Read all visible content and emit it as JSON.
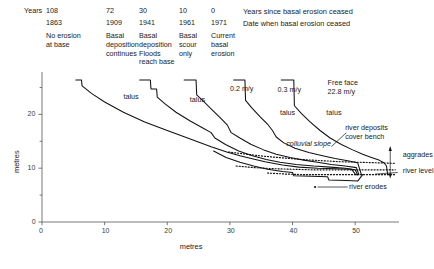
{
  "header": {
    "years_label": "Years",
    "columns": [
      {
        "years_since": "108",
        "date": "1863",
        "desc": "No erosion\nat base",
        "x": 46
      },
      {
        "years_since": "72",
        "date": "1909",
        "desc": "Basal\ndeposition\ncontinues",
        "x": 106
      },
      {
        "years_since": "30",
        "date": "1941",
        "desc": "Basal\ndeposition\nFloods\nreach base",
        "x": 139
      },
      {
        "years_since": "10",
        "date": "1961",
        "desc": "Basal\nscour\nonly",
        "x": 179
      },
      {
        "years_since": "0",
        "date": "1971",
        "desc": "Current\nbasal\nerosion",
        "x": 211
      }
    ],
    "legend_row1": "Years since basal erosion ceased",
    "legend_row2": "Date when basal erosion ceased",
    "legend_x": 243
  },
  "chart_data": {
    "type": "line",
    "title": "",
    "xlabel": "metres",
    "ylabel": "metres",
    "xlim": [
      0,
      57
    ],
    "ylim": [
      0,
      27.5
    ],
    "xticks": [
      0,
      10,
      20,
      30,
      40,
      50
    ],
    "yticks": [
      0,
      10,
      20
    ],
    "yticks_minor": [
      5,
      15,
      25
    ],
    "grid": false,
    "legend_position": "none",
    "series": [
      {
        "name": "1863 profile (108 years, no erosion at base)",
        "style": "solid",
        "points": [
          [
            5.4,
            26.4
          ],
          [
            6.3,
            26.4
          ],
          [
            6.4,
            25.3
          ],
          [
            7.9,
            23.9
          ],
          [
            10.0,
            22.3
          ],
          [
            13.0,
            20.4
          ],
          [
            16.4,
            18.6
          ],
          [
            20.0,
            17.0
          ],
          [
            24.0,
            15.3
          ],
          [
            27.0,
            14.0
          ],
          [
            29.5,
            13.0
          ],
          [
            31.6,
            12.3
          ],
          [
            33.4,
            11.8
          ],
          [
            35.6,
            11.2
          ],
          [
            38.4,
            10.6
          ],
          [
            41.0,
            10.2
          ],
          [
            44.0,
            10.0
          ],
          [
            47.0,
            9.9
          ],
          [
            49.4,
            9.8
          ],
          [
            50.1,
            8.8
          ],
          [
            50.4,
            8.8
          ]
        ]
      },
      {
        "name": "1909 profile (72 years, basal deposition continues)",
        "style": "solid",
        "points": [
          [
            15.6,
            26.4
          ],
          [
            17.3,
            26.4
          ],
          [
            17.4,
            24.7
          ],
          [
            18.3,
            24.7
          ],
          [
            18.4,
            23.2
          ],
          [
            19.6,
            22.0
          ],
          [
            21.4,
            20.4
          ],
          [
            23.6,
            18.8
          ],
          [
            25.6,
            17.5
          ],
          [
            27.0,
            16.6
          ],
          [
            27.6,
            15.6
          ],
          [
            29.3,
            14.4
          ],
          [
            31.4,
            13.2
          ],
          [
            33.6,
            12.3
          ],
          [
            35.8,
            11.6
          ],
          [
            38.0,
            11.1
          ],
          [
            40.6,
            10.7
          ],
          [
            43.4,
            10.4
          ],
          [
            46.0,
            10.2
          ],
          [
            48.4,
            10.0
          ],
          [
            50.0,
            9.7
          ],
          [
            50.4,
            8.8
          ]
        ]
      },
      {
        "name": "1941 profile (30 years, basal deposition / floods reach base)",
        "style": "solid",
        "points": [
          [
            22.7,
            26.4
          ],
          [
            24.6,
            26.4
          ],
          [
            24.7,
            23.6
          ],
          [
            25.8,
            22.4
          ],
          [
            27.2,
            20.8
          ],
          [
            28.6,
            19.2
          ],
          [
            29.6,
            18.0
          ],
          [
            30.2,
            16.6
          ],
          [
            31.6,
            15.6
          ],
          [
            33.4,
            14.4
          ],
          [
            35.4,
            13.4
          ],
          [
            37.4,
            12.6
          ],
          [
            39.6,
            12.0
          ],
          [
            41.8,
            11.5
          ],
          [
            44.0,
            11.1
          ],
          [
            46.2,
            10.7
          ],
          [
            48.4,
            10.4
          ],
          [
            50.2,
            10.1
          ],
          [
            50.6,
            8.8
          ]
        ]
      },
      {
        "name": "1961 profile (10 years, basal scour only)",
        "style": "solid",
        "points": [
          [
            30.6,
            26.4
          ],
          [
            32.4,
            26.4
          ],
          [
            32.5,
            22.6
          ],
          [
            33.5,
            21.2
          ],
          [
            34.8,
            19.6
          ],
          [
            36.0,
            18.2
          ],
          [
            36.8,
            17.0
          ],
          [
            37.4,
            15.8
          ],
          [
            38.6,
            14.7
          ],
          [
            40.4,
            13.7
          ],
          [
            42.6,
            12.9
          ],
          [
            44.8,
            12.3
          ],
          [
            46.8,
            11.8
          ],
          [
            48.8,
            11.4
          ],
          [
            50.4,
            11.0
          ],
          [
            51.0,
            8.8
          ]
        ]
      },
      {
        "name": "1971 profile (0 years, current basal erosion, free face 22.8 m/y)",
        "style": "solid",
        "points": [
          [
            38.2,
            26.4
          ],
          [
            40.2,
            26.4
          ],
          [
            40.3,
            21.6
          ],
          [
            41.4,
            20.2
          ],
          [
            42.8,
            18.6
          ],
          [
            44.4,
            17.0
          ],
          [
            46.0,
            15.6
          ],
          [
            47.8,
            14.4
          ],
          [
            49.6,
            13.4
          ],
          [
            51.2,
            12.6
          ],
          [
            52.6,
            12.0
          ],
          [
            53.8,
            11.5
          ],
          [
            54.6,
            11.0
          ],
          [
            55.0,
            10.4
          ],
          [
            55.2,
            8.8
          ]
        ]
      },
      {
        "name": "colluvial slope (dotted, upper)",
        "style": "dotted",
        "points": [
          [
            29.8,
            13.0
          ],
          [
            32.6,
            12.6
          ],
          [
            35.6,
            12.2
          ],
          [
            38.6,
            11.9
          ],
          [
            41.6,
            11.6
          ],
          [
            44.6,
            11.4
          ],
          [
            47.6,
            11.2
          ],
          [
            50.6,
            11.1
          ],
          [
            53.6,
            11.0
          ],
          [
            56.4,
            10.9
          ]
        ]
      },
      {
        "name": "river deposits cover bench (dotted, middle)",
        "style": "dotted",
        "points": [
          [
            31.0,
            10.4
          ],
          [
            34.0,
            10.1
          ],
          [
            37.0,
            9.9
          ],
          [
            40.0,
            9.8
          ],
          [
            43.0,
            9.7
          ],
          [
            46.0,
            9.7
          ],
          [
            49.0,
            9.7
          ],
          [
            52.0,
            9.7
          ],
          [
            55.0,
            9.7
          ],
          [
            56.4,
            9.7
          ]
        ]
      },
      {
        "name": "aggradation surface (dotted, lower)",
        "style": "dotted",
        "points": [
          [
            36.0,
            9.1
          ],
          [
            39.0,
            8.9
          ],
          [
            42.0,
            8.8
          ],
          [
            45.0,
            8.8
          ],
          [
            48.0,
            8.8
          ],
          [
            51.0,
            8.8
          ],
          [
            54.0,
            8.8
          ],
          [
            56.4,
            8.8
          ]
        ]
      },
      {
        "name": "valley floor / river bed (solid lower envelope)",
        "style": "solid",
        "points": [
          [
            27.4,
            13.2
          ],
          [
            29.4,
            12.0
          ],
          [
            31.6,
            11.1
          ],
          [
            33.8,
            10.4
          ],
          [
            36.0,
            9.8
          ],
          [
            38.4,
            9.4
          ],
          [
            40.0,
            9.2
          ],
          [
            40.2,
            8.6
          ],
          [
            43.0,
            8.5
          ],
          [
            45.6,
            8.4
          ],
          [
            45.8,
            7.8
          ],
          [
            48.6,
            7.7
          ],
          [
            50.4,
            7.6
          ],
          [
            51.2,
            8.8
          ]
        ]
      }
    ],
    "annotations": [
      {
        "text": "talus",
        "x": 13.0,
        "y": 23.0,
        "italic": false,
        "id": "talus-1"
      },
      {
        "text": "talus",
        "x": 23.6,
        "y": 22.4,
        "italic": false,
        "id": "talus-2"
      },
      {
        "text": "0.2 m/y",
        "x": 30.0,
        "y": 24.6,
        "italic": false,
        "id": "rate-02"
      },
      {
        "text": "0.3 m/y",
        "x": 37.6,
        "y": 24.4,
        "italic": false,
        "id": "rate-03"
      },
      {
        "text": "talus",
        "x": 38.0,
        "y": 20.0,
        "italic": false,
        "id": "talus-3"
      },
      {
        "text": "talus",
        "x": 45.4,
        "y": 20.1,
        "italic": false,
        "id": "talus-4"
      },
      {
        "text": "Free face\n22.8 m/y",
        "x": 45.6,
        "y": 25.6,
        "italic": false,
        "id": "free-face"
      },
      {
        "text": "colluvial slope",
        "x": 39.0,
        "y": 14.4,
        "italic": true,
        "id": "colluvial-slope"
      },
      {
        "text": "river deposits\ncover bench",
        "x": 48.4,
        "y": 17.2,
        "italic": false,
        "id": "river-deposits"
      },
      {
        "text": "aggrades",
        "x": 57.6,
        "y": 12.2,
        "italic": false,
        "id": "aggrades"
      },
      {
        "text": "river level",
        "x": 57.6,
        "y": 9.2,
        "italic": false,
        "id": "river-level"
      },
      {
        "text": "river erodes",
        "x": 49.0,
        "y": 6.4,
        "italic": false,
        "id": "river-erodes"
      }
    ]
  }
}
